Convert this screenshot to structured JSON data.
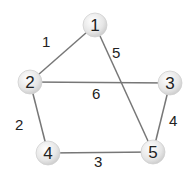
{
  "graph": {
    "nodes": [
      {
        "id": "1",
        "label": "1",
        "x": 95,
        "y": 25
      },
      {
        "id": "2",
        "label": "2",
        "x": 30,
        "y": 82
      },
      {
        "id": "3",
        "label": "3",
        "x": 170,
        "y": 83
      },
      {
        "id": "4",
        "label": "4",
        "x": 48,
        "y": 153
      },
      {
        "id": "5",
        "label": "5",
        "x": 153,
        "y": 152
      }
    ],
    "edges": [
      {
        "from": "1",
        "to": "2",
        "weight": "1",
        "lx": 42,
        "ly": 47
      },
      {
        "from": "1",
        "to": "5",
        "weight": "5",
        "lx": 112,
        "ly": 58
      },
      {
        "from": "2",
        "to": "3",
        "weight": "6",
        "lx": 92,
        "ly": 99
      },
      {
        "from": "2",
        "to": "4",
        "weight": "2",
        "lx": 15,
        "ly": 130
      },
      {
        "from": "3",
        "to": "5",
        "weight": "4",
        "lx": 169,
        "ly": 126
      },
      {
        "from": "4",
        "to": "5",
        "weight": "3",
        "lx": 94,
        "ly": 167
      }
    ]
  }
}
